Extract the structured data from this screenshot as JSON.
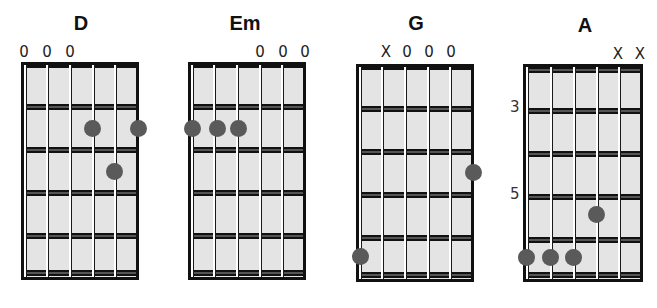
{
  "colors": {
    "dot": "#5a5a5a",
    "board": "#e4e4e4",
    "line": "#111111"
  },
  "chords": [
    {
      "name": "D",
      "markers": [
        "0",
        "0",
        "0",
        "",
        "",
        ""
      ],
      "fret_label": [],
      "dots": [
        [
          4,
          2
        ],
        [
          6,
          2
        ],
        [
          5,
          3
        ]
      ]
    },
    {
      "name": "Em",
      "markers": [
        "",
        "",
        "",
        "0",
        "0",
        "0"
      ],
      "fret_label": [],
      "dots": [
        [
          1,
          2
        ],
        [
          2,
          2
        ],
        [
          3,
          2
        ]
      ]
    },
    {
      "name": "G",
      "markers": [
        "",
        "X",
        "0",
        "0",
        "0",
        ""
      ],
      "fret_label": [],
      "dots": [
        [
          6,
          3
        ],
        [
          1,
          5
        ]
      ]
    },
    {
      "name": "A",
      "markers": [
        "",
        "",
        "",
        "",
        "X",
        "X"
      ],
      "fret_label": [
        "3",
        "5"
      ],
      "dots": [
        [
          4,
          4
        ],
        [
          1,
          5
        ],
        [
          2,
          5
        ],
        [
          3,
          5
        ]
      ]
    }
  ]
}
